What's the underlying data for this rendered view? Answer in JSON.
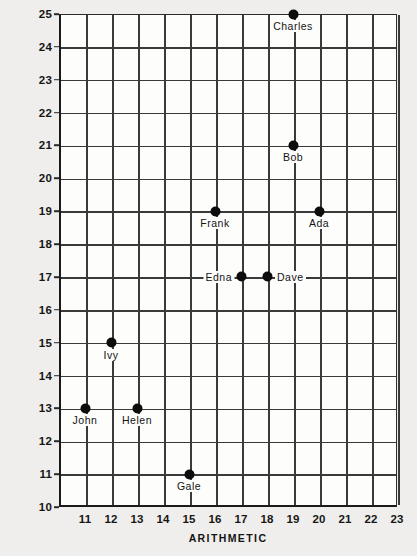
{
  "chart_data": {
    "type": "scatter",
    "title": "",
    "xlabel": "ARITHMETIC",
    "ylabel": "SCIENCE",
    "xlim": [
      10,
      23
    ],
    "ylim": [
      10,
      25
    ],
    "xticks": [
      "11",
      "12",
      "13",
      "14",
      "15",
      "16",
      "17",
      "18",
      "19",
      "20",
      "21",
      "22",
      "23"
    ],
    "yticks": [
      "25",
      "24",
      "23",
      "22",
      "21",
      "20",
      "19",
      "18",
      "17",
      "16",
      "15",
      "14",
      "13",
      "12",
      "11",
      "10"
    ],
    "grid": true,
    "legend": "none",
    "points": [
      {
        "label": "Charles",
        "x": 19,
        "y": 25,
        "label_pos": "below"
      },
      {
        "label": "Bob",
        "x": 19,
        "y": 21,
        "label_pos": "below"
      },
      {
        "label": "Frank",
        "x": 16,
        "y": 19,
        "label_pos": "below"
      },
      {
        "label": "Ada",
        "x": 20,
        "y": 19,
        "label_pos": "below"
      },
      {
        "label": "Edna",
        "x": 17,
        "y": 17,
        "label_pos": "left"
      },
      {
        "label": "Dave",
        "x": 18,
        "y": 17,
        "label_pos": "right"
      },
      {
        "label": "Ivy",
        "x": 12,
        "y": 15,
        "label_pos": "below"
      },
      {
        "label": "John",
        "x": 11,
        "y": 13,
        "label_pos": "below"
      },
      {
        "label": "Helen",
        "x": 13,
        "y": 13,
        "label_pos": "below"
      },
      {
        "label": "Gale",
        "x": 15,
        "y": 11,
        "label_pos": "below"
      }
    ]
  },
  "axes": {
    "x_title": "ARITHMETIC",
    "y_title": "SCIENCE"
  },
  "colors": {
    "page_background": "#efeeec",
    "plot_background": "#fdfdfc",
    "grid": "#3a3a3a",
    "axis": "#1a1a1a",
    "marker": "#0d0d0d",
    "text": "#141414"
  }
}
